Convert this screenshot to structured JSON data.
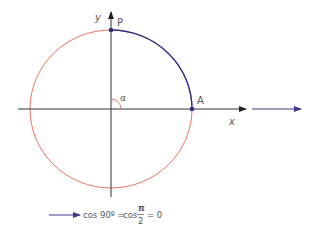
{
  "diagram": {
    "axes": {
      "x_label": "x",
      "y_label": "y"
    },
    "points": {
      "P": "P",
      "A": "A"
    },
    "angle_label": "α",
    "formula": {
      "left": "cos 90º =",
      "mid": "cos",
      "frac_num": "π",
      "frac_den": "2",
      "right": "= 0"
    },
    "colors": {
      "circle": "#e8735f",
      "arc": "#2e2f8a",
      "axis": "#333333",
      "arrow": "#3b3b8c",
      "point": "#2e2f8a"
    }
  }
}
